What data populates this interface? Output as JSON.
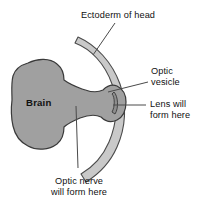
{
  "figure": {
    "type": "biological-diagram",
    "colors": {
      "background": "#ffffff",
      "tissue_fill": "#a0a0a0",
      "tissue_outline": "#3a3a3a",
      "ectoderm_fill": "#c9c9c9",
      "ectoderm_outline": "#4a4a4a",
      "leader_line": "#4a4a4a",
      "text": "#111111"
    }
  },
  "labels": {
    "ectoderm": {
      "line1": "Ectoderm of head",
      "line2": ""
    },
    "optic_vesicle": {
      "line1": "Optic",
      "line2": "vesicle"
    },
    "lens": {
      "line1": "Lens will",
      "line2": "form here"
    },
    "optic_nerve": {
      "line1": "Optic nerve",
      "line2": "will form here"
    },
    "brain": {
      "text": "Brain"
    }
  },
  "structures": [
    {
      "name": "brain",
      "label": "Brain"
    },
    {
      "name": "optic-stalk",
      "label": "Optic nerve will form here"
    },
    {
      "name": "optic-vesicle",
      "label": "Optic vesicle"
    },
    {
      "name": "surface-ectoderm",
      "label": "Ectoderm of head"
    },
    {
      "name": "lens-placode",
      "label": "Lens will form here"
    }
  ]
}
